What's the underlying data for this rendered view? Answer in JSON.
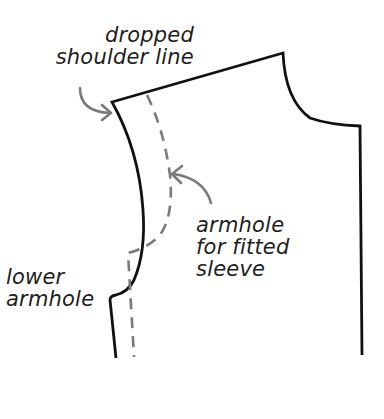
{
  "diagram": {
    "colors": {
      "pattern_line": "#111111",
      "dashed_line": "#7a7a7a",
      "arrow": "#7a7a7a",
      "text": "#1e1e1e",
      "background": "#ffffff"
    },
    "labels": {
      "dropped_shoulder": {
        "line1": "dropped",
        "line2": "shoulder line"
      },
      "fitted_armhole": {
        "line1": "armhole",
        "line2": "for fitted",
        "line3": "sleeve"
      },
      "lower_armhole": {
        "line1": "lower",
        "line2": "armhole"
      }
    },
    "elements": [
      {
        "id": "pattern-outline",
        "type": "solid-line",
        "description": "bodice outline with dropped shoulder and lowered armhole"
      },
      {
        "id": "fitted-armhole-line",
        "type": "dashed-line",
        "description": "original armhole for fitted sleeve"
      },
      {
        "id": "arrow-dropped-shoulder",
        "type": "arrow",
        "points_to": "dropped shoulder point"
      },
      {
        "id": "arrow-fitted-armhole",
        "type": "arrow",
        "points_to": "dashed armhole line"
      }
    ]
  }
}
